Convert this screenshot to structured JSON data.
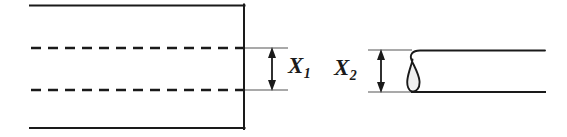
{
  "figure": {
    "background_color": "#ffffff",
    "line_color": "#1a1a1a",
    "fill_color": "#f0f0f0",
    "width": 567,
    "height": 137
  },
  "dimensions": [
    {
      "id": "x1",
      "label_main": "X",
      "label_sub": "1",
      "label_text": "X1",
      "arrow_x": 272,
      "arrow_top_y": 48,
      "arrow_bottom_y": 90,
      "extension_start_x": 244,
      "extension_end_x": 288,
      "value_px": 42
    },
    {
      "id": "x2",
      "label_main": "X",
      "label_sub": "2",
      "label_text": "X2",
      "arrow_x": 381,
      "arrow_top_y": 50,
      "arrow_bottom_y": 92,
      "extension_start_x": 368,
      "extension_end_x": 412,
      "value_px": 42
    }
  ],
  "shapes": {
    "left_part": {
      "name": "open-flat-band",
      "top_edge_y": 5,
      "bottom_edge_y": 128,
      "left_x": 30,
      "right_x": 244,
      "dashed_lines_y": [
        48,
        90
      ],
      "dash_pattern": "10 7",
      "open_side": "left"
    },
    "right_part": {
      "name": "rolled-hem-band",
      "top_edge_y": 50,
      "bottom_edge_y": 92,
      "left_x": 410,
      "right_x": 545,
      "hem_style": "curled-teardrop-loop"
    }
  }
}
